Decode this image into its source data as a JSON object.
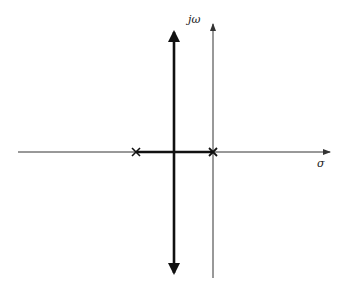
{
  "diagram": {
    "type": "root-locus",
    "axes": {
      "real_label": "σ",
      "imag_label": "jω"
    },
    "poles": [
      {
        "name": "pole-1",
        "marker": "×",
        "position": "left of imaginary axis"
      },
      {
        "name": "pole-2",
        "marker": "×",
        "position": "at origin"
      }
    ],
    "branches": [
      {
        "name": "real-axis-segment",
        "description": "between the two poles"
      },
      {
        "name": "vertical-asymptote-branch",
        "description": "vertical line through breakaway point, arrows up and down"
      }
    ],
    "colors": {
      "axis": "#333333",
      "locus": "#111111",
      "background": "#ffffff"
    }
  }
}
